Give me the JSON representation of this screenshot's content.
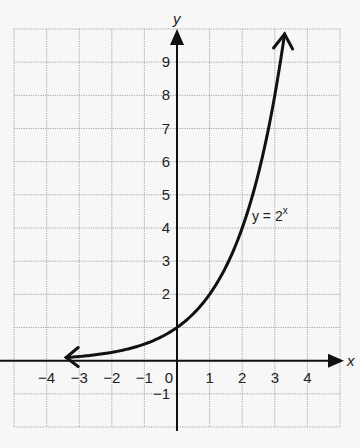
{
  "chart_data": {
    "type": "line",
    "title": "",
    "xlabel": "x",
    "ylabel": "y",
    "xlim": [
      -5,
      5
    ],
    "ylim": [
      -2,
      10
    ],
    "grid": true,
    "x_ticks": [
      -4,
      -3,
      -2,
      -1,
      0,
      1,
      2,
      3,
      4
    ],
    "y_ticks": [
      -1,
      2,
      3,
      4,
      5,
      6,
      7,
      8,
      9
    ],
    "series": [
      {
        "name": "y = 2^x",
        "label": "y = 2",
        "label_exponent": "x",
        "function": "2^x",
        "x": [
          -3.4,
          -3,
          -2,
          -1,
          0,
          1,
          2,
          3,
          3.3
        ],
        "y": [
          0.09,
          0.125,
          0.25,
          0.5,
          1,
          2,
          4,
          8,
          9.85
        ],
        "arrows": "both"
      }
    ],
    "annotations": [
      {
        "text": "y = 2^x",
        "x": 2.3,
        "y": 4.2
      }
    ]
  },
  "labels": {
    "x_axis": "x",
    "y_axis": "y",
    "func_main": "y = 2",
    "func_exp": "x"
  }
}
